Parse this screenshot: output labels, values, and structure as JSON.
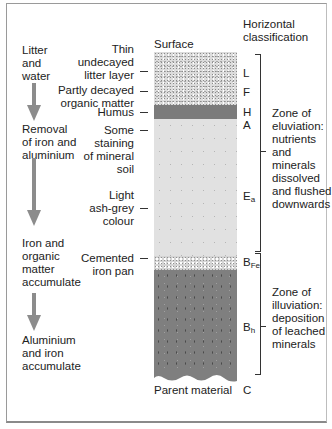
{
  "process_column": {
    "stages": [
      {
        "label": "Litter\nand\nwater"
      },
      {
        "label": "Removal\nof iron and\naluminium"
      },
      {
        "label": "Iron and\norganic\nmatter\naccumulate"
      },
      {
        "label": "Aluminium\nand iron\naccumulate"
      }
    ],
    "arrow_color": "#8c8c8c"
  },
  "profile": {
    "top_label": "Surface",
    "bottom_label": "Parent material",
    "layer_descriptions": [
      {
        "label": "Thin\nundecayed\nlitter layer"
      },
      {
        "label": "Partly decayed\norganic matter"
      },
      {
        "label": "Humus"
      },
      {
        "label": "Some\nstaining\nof mineral\nsoil"
      },
      {
        "label": "Light\nash-grey\ncolour"
      },
      {
        "label": "Cemented\niron pan"
      }
    ],
    "colors": {
      "litter": "#dcdcdc",
      "humus": "#7b7b7b",
      "eluviated": "#e1e1e1",
      "iron_pan": "#d4d4d4",
      "illuviated": "#7f7f7f"
    }
  },
  "horizons": {
    "heading": "Horizontal\nclassification",
    "labels": {
      "L": "L",
      "F": "F",
      "H": "H",
      "A": "A",
      "Ea_main": "E",
      "Ea_sub": "a",
      "BFe_main": "B",
      "BFe_sub": "Fe",
      "Bh_main": "B",
      "Bh_sub": "h",
      "C": "C"
    }
  },
  "zones": [
    {
      "label": "Zone of\neluviation:\nnutrients\nand\nminerals\ndissolved\nand flushed\ndownwards"
    },
    {
      "label": "Zone of\nilluviation:\ndeposition\nof leached\nminerals"
    }
  ]
}
